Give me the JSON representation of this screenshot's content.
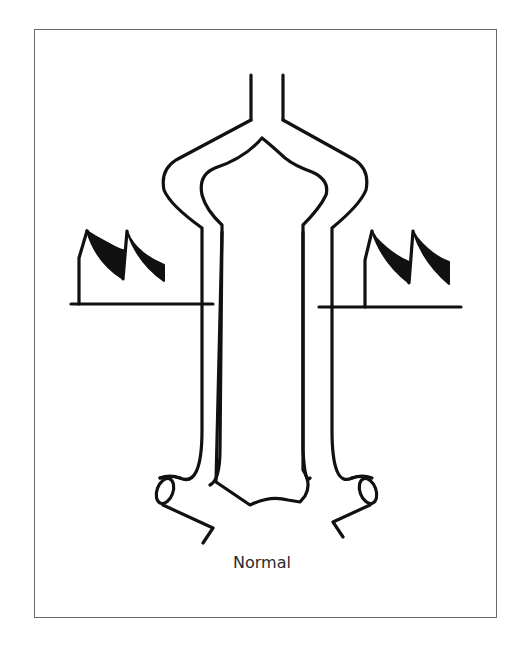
{
  "figure": {
    "caption": "Normal",
    "colors": {
      "stroke": "#111111",
      "fill": "#111111",
      "frame": "#6a6a6a",
      "background": "#ffffff"
    }
  },
  "structures": {
    "outer_vessel": "Outer tubular vessel branching to a narrow neck at top",
    "inner_lumen": "Inner elongated lumen",
    "side_branches": [
      "left-branch-stub",
      "right-branch-stub"
    ],
    "waveforms": [
      {
        "side": "left",
        "peaks": 2,
        "shape": "sawtooth-filled"
      },
      {
        "side": "right",
        "peaks": 2,
        "shape": "sawtooth-filled"
      }
    ]
  }
}
